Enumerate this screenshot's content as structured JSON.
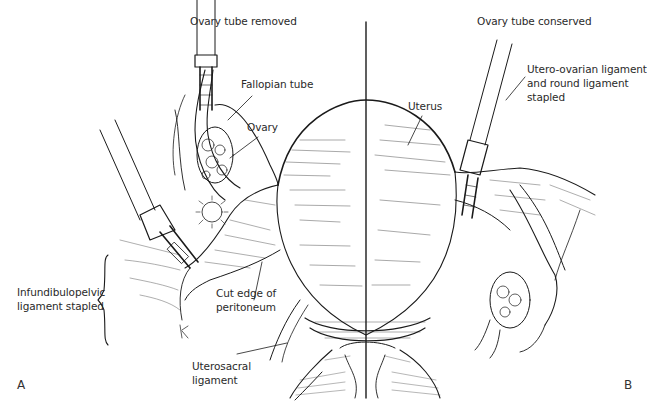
{
  "figure": {
    "panels": [
      {
        "letter": "A",
        "title": "Ovary tube removed"
      },
      {
        "letter": "B",
        "title": "Ovary tube conserved"
      }
    ],
    "labels": {
      "fallopian_tube": "Fallopian tube",
      "ovary": "Ovary",
      "uterus": "Uterus",
      "utero_ovarian_1": "Utero-ovarian ligament",
      "utero_ovarian_2": "and round ligament",
      "utero_ovarian_3": "stapled",
      "infundibulopelvic_1": "Infundibulopelvic",
      "infundibulopelvic_2": "ligament stapled",
      "cut_edge_1": "Cut edge of",
      "cut_edge_2": "peritoneum",
      "uterosacral_1": "Uterosacral",
      "uterosacral_2": "ligament"
    },
    "colors": {
      "ink": "#1a1a1a",
      "background": "#ffffff"
    }
  }
}
